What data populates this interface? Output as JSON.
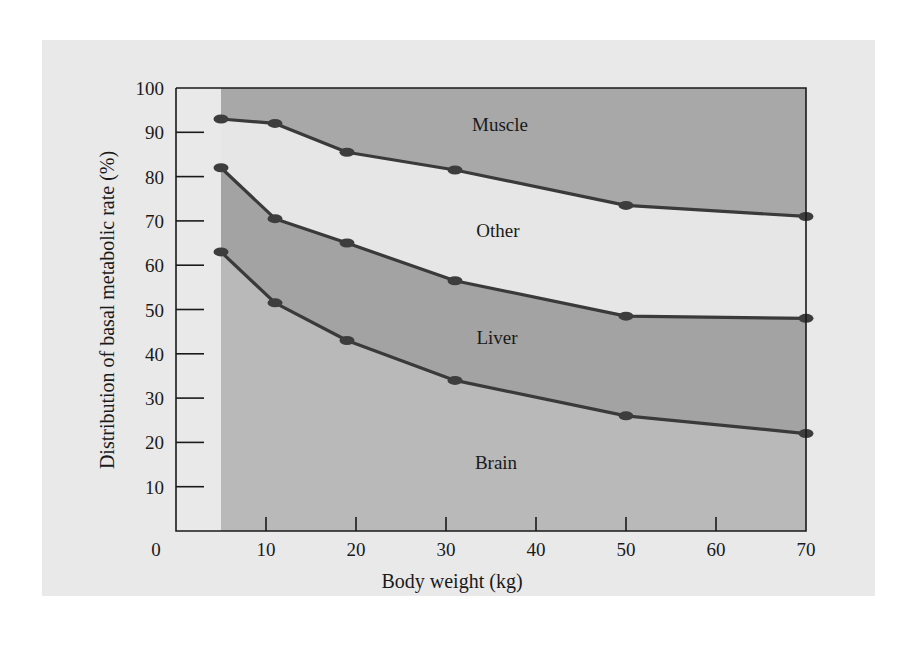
{
  "chart_data": {
    "type": "area",
    "stacked": true,
    "title": "",
    "xlabel": "Body weight (kg)",
    "ylabel": "Distribution of basal metabolic rate (%)",
    "xlim": [
      0,
      70
    ],
    "ylim": [
      0,
      100
    ],
    "x_ticks": [
      "0",
      "10",
      "20",
      "30",
      "40",
      "50",
      "60",
      "70"
    ],
    "y_ticks": [
      "10",
      "20",
      "30",
      "40",
      "50",
      "60",
      "70",
      "80",
      "90",
      "100"
    ],
    "grid": false,
    "legend": "inline region labels",
    "x": [
      5,
      11,
      19,
      31,
      50,
      70
    ],
    "boundaries": [
      {
        "name": "Brain upper boundary",
        "values": [
          63,
          51.5,
          43,
          34,
          26,
          22
        ]
      },
      {
        "name": "Liver upper boundary",
        "values": [
          82,
          70.5,
          65,
          56.5,
          48.5,
          48
        ]
      },
      {
        "name": "Other upper boundary",
        "values": [
          93,
          92,
          85.5,
          81.5,
          73.5,
          71
        ]
      }
    ],
    "series": [
      {
        "name": "Brain",
        "values": [
          63,
          51.5,
          43,
          34,
          26,
          22
        ]
      },
      {
        "name": "Liver",
        "values": [
          19,
          19,
          22,
          22.5,
          22.5,
          26
        ]
      },
      {
        "name": "Other",
        "values": [
          11,
          21.5,
          20.5,
          25,
          25,
          23
        ]
      },
      {
        "name": "Muscle",
        "values": [
          7,
          8,
          14.5,
          18.5,
          26.5,
          29
        ]
      }
    ],
    "region_labels": [
      "Muscle",
      "Other",
      "Liver",
      "Brain"
    ],
    "colors": {
      "panel_background": "#e9e9e9",
      "brain": "#b9b9b9",
      "liver": "#a3a3a3",
      "other": "#e6e6e6",
      "muscle": "#a8a8a8",
      "line": "#3a3a3a",
      "marker": "#3d3d3d"
    }
  }
}
